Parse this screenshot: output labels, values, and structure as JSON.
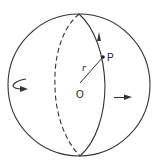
{
  "diagram": {
    "title": "",
    "labels": {
      "center": "O",
      "point": "P",
      "radius": "r"
    },
    "colors": {
      "stroke": "#333333",
      "background": "#ffffff"
    },
    "elements": [
      {
        "id": "sphere-outline",
        "type": "circle"
      },
      {
        "id": "meridian-front",
        "type": "solid-arc",
        "arrow": "upward"
      },
      {
        "id": "meridian-back",
        "type": "dashed-arc"
      },
      {
        "id": "radius-line",
        "from": "O",
        "to": "P",
        "label": "r"
      },
      {
        "id": "rotation-arrow-left",
        "type": "curved-arrow"
      },
      {
        "id": "motion-arrow-right",
        "type": "straight-arrow",
        "direction": "right"
      }
    ]
  }
}
